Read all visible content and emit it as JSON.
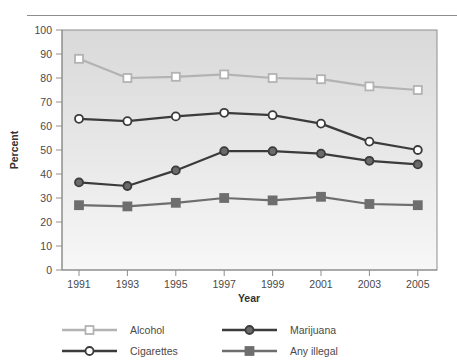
{
  "chart_data": {
    "type": "line",
    "title": "",
    "xlabel": "Year",
    "ylabel": "Percent",
    "categories": [
      "1991",
      "1993",
      "1995",
      "1997",
      "1999",
      "2001",
      "2003",
      "2005"
    ],
    "x": [
      1991,
      1993,
      1995,
      1997,
      1999,
      2001,
      2003,
      2005
    ],
    "xlim": [
      1990,
      2006
    ],
    "ylim": [
      0,
      100
    ],
    "ytick_labels": [
      "0",
      "10",
      "20",
      "30",
      "40",
      "50",
      "60",
      "70",
      "80",
      "90",
      "100"
    ],
    "yticks": [
      0,
      10,
      20,
      30,
      40,
      50,
      60,
      70,
      80,
      90,
      100
    ],
    "grid": false,
    "legend_position": "bottom",
    "series": [
      {
        "name": "Alcohol",
        "values": [
          88,
          80,
          80.5,
          81.5,
          80,
          79.5,
          76.5,
          75
        ],
        "color": "#b3b3b3",
        "marker": "open-square"
      },
      {
        "name": "Cigarettes",
        "values": [
          63,
          62,
          64,
          65.5,
          64.5,
          61,
          53.5,
          50
        ],
        "color": "#3b3b3b",
        "marker": "open-circle"
      },
      {
        "name": "Marijuana",
        "values": [
          36.5,
          35,
          41.5,
          49.5,
          49.5,
          48.5,
          45.5,
          44
        ],
        "color": "#3b3b3b",
        "marker": "filled-circle"
      },
      {
        "name": "Any illegal",
        "values": [
          27,
          26.5,
          28,
          30,
          29,
          30.5,
          27.5,
          27
        ],
        "color": "#6e6e6e",
        "marker": "filled-square"
      }
    ]
  },
  "legend": {
    "entries": [
      {
        "label": "Alcohol"
      },
      {
        "label": "Cigarettes"
      },
      {
        "label": "Marijuana"
      },
      {
        "label": "Any illegal"
      }
    ]
  },
  "colors": {
    "alcohol": "#b3b3b3",
    "cigarettes": "#3b3b3b",
    "marijuana": "#3b3b3b",
    "marijuana_fill": "#6a6a6a",
    "any_illegal": "#6e6e6e",
    "plot_border": "#8e8e8e",
    "axis_text": "#4a4a4a"
  }
}
